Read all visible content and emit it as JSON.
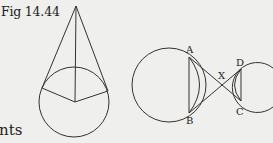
{
  "figure": {
    "caption": "Fig 14.44",
    "trailing_text": "nts",
    "diagram_left": {
      "description": "Cone-like figure: apex point with two tangent lines to a circle, and radii from center to tangent points plus line from apex to center"
    },
    "diagram_right": {
      "description": "Two circles with chords AB and DC, lines AC and BD crossing at X",
      "labels": {
        "A": "A",
        "B": "B",
        "C": "C",
        "D": "D",
        "X": "X"
      }
    }
  }
}
